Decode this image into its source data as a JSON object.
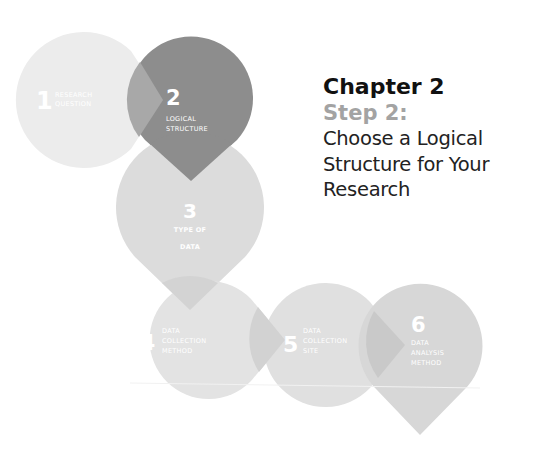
{
  "heading": {
    "chapter": "Chapter 2",
    "step": "Step 2:",
    "description_lines": [
      "Choose a Logical",
      "Structure for Your",
      "Research"
    ]
  },
  "steps": [
    {
      "number": "1",
      "label_lines": [
        "RESEARCH",
        "QUESTION"
      ],
      "color": "#ececec",
      "active": false
    },
    {
      "number": "2",
      "label_lines": [
        "LOGICAL",
        "STRUCTURE"
      ],
      "color": "#8d8d8d",
      "active": true
    },
    {
      "number": "3",
      "label_lines": [
        "TYPE OF",
        "DATA"
      ],
      "color": "#dcdcdc",
      "active": false
    },
    {
      "number": "4",
      "label_lines": [
        "DATA",
        "COLLECTION",
        "METHOD"
      ],
      "color": "#e3e3e3",
      "active": false
    },
    {
      "number": "5",
      "label_lines": [
        "DATA",
        "COLLECTION",
        "SITE"
      ],
      "color": "#e0e0e0",
      "active": false
    },
    {
      "number": "6",
      "label_lines": [
        "DATA",
        "ANALYSIS",
        "METHOD"
      ],
      "color": "#d7d7d7",
      "active": false
    }
  ],
  "colors": {
    "active_step": "#8d8d8d",
    "step_heading": "#a3a3a3",
    "chapter_heading": "#111111"
  }
}
